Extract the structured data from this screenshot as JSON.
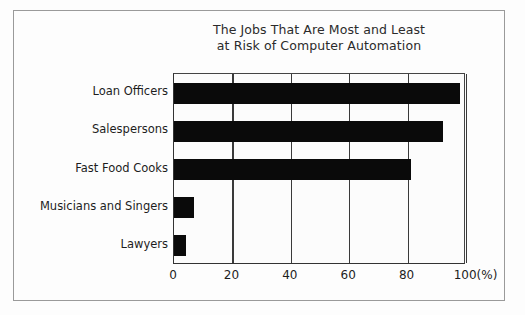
{
  "chart_data": {
    "type": "bar",
    "orientation": "horizontal",
    "title": "The Jobs That Are Most and Least at Risk of Computer Automation",
    "title_lines": [
      "The Jobs That Are Most and Least",
      "at Risk of Computer Automation"
    ],
    "categories": [
      "Loan Officers",
      "Salespersons",
      "Fast Food Cooks",
      "Musicians and Singers",
      "Lawyers"
    ],
    "values": [
      98,
      92,
      81,
      7,
      4
    ],
    "xlabel": "(%)",
    "ylabel": "",
    "xlim": [
      0,
      100
    ],
    "xticks": [
      0,
      20,
      40,
      60,
      80,
      100
    ],
    "xticklabels": [
      "0",
      "20",
      "40",
      "60",
      "80",
      "100(%)"
    ],
    "grid": true,
    "grid_axis": "x",
    "legend": false,
    "bar_color": "#0a0a0a",
    "grid_color": "#3a3a3a",
    "axis_color": "#333333",
    "background_color": "#fcfcfc",
    "frame_color": "#9a9a9a",
    "text_color": "#1d1d1d"
  }
}
